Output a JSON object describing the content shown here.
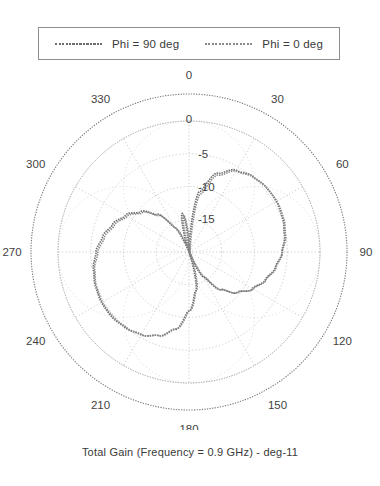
{
  "legend": {
    "entries": [
      {
        "label": "Phi = 90 deg",
        "color": "#6e6e6e",
        "style": "dotted-line"
      },
      {
        "label": "Phi = 0 deg",
        "color": "#8a8a8a",
        "style": "dotted-line"
      }
    ]
  },
  "caption": {
    "text": "Total Gain (Frequency = 0.9 GHz) - deg-11"
  },
  "axes": {
    "angle_labels": [
      "0",
      "30",
      "60",
      "90",
      "120",
      "150",
      "180",
      "210",
      "240",
      "270",
      "300",
      "330"
    ],
    "radial_labels": [
      "0",
      "-5",
      "-10",
      "-15"
    ]
  },
  "chart_data": {
    "type": "line",
    "subtype": "polar",
    "title": "Total Gain (Frequency = 0.9 GHz) - deg-11",
    "xlabel": "Theta (deg)",
    "ylabel": "Total Gain (dB)",
    "rlim": [
      -20,
      0
    ],
    "r_ticks": [
      0,
      -5,
      -10,
      -15
    ],
    "theta_ticks": [
      0,
      30,
      60,
      90,
      120,
      150,
      180,
      210,
      240,
      270,
      300,
      330
    ],
    "theta_zero_location": "N",
    "theta_direction": "clockwise",
    "grid": true,
    "legend_position": "top",
    "series": [
      {
        "name": "Phi = 90 deg",
        "color": "#6e6e6e",
        "theta": [
          0,
          10,
          20,
          30,
          40,
          50,
          60,
          70,
          80,
          90,
          100,
          110,
          120,
          130,
          140,
          150,
          160,
          170,
          180,
          190,
          200,
          210,
          220,
          230,
          240,
          250,
          260,
          270,
          280,
          290,
          300,
          310,
          320,
          330,
          340,
          350,
          360
        ],
        "r": [
          -20,
          -10.6,
          -7.2,
          -5.6,
          -4.9,
          -4.6,
          -4.6,
          -4.8,
          -5.2,
          -5.8,
          -6.6,
          -7.6,
          -8.8,
          -10.4,
          -12.5,
          -15.6,
          -20,
          -14.0,
          -11.0,
          -8.0,
          -6.4,
          -5.4,
          -4.9,
          -4.6,
          -4.6,
          -4.8,
          -5.2,
          -5.8,
          -6.6,
          -7.6,
          -8.8,
          -10.4,
          -12.5,
          -15.6,
          -20,
          -14.0,
          -20
        ]
      },
      {
        "name": "Phi = 0 deg",
        "color": "#8a8a8a",
        "theta": [
          0,
          10,
          20,
          30,
          40,
          50,
          60,
          70,
          80,
          90,
          100,
          110,
          120,
          130,
          140,
          150,
          160,
          170,
          180,
          190,
          200,
          210,
          220,
          230,
          240,
          250,
          260,
          270,
          280,
          290,
          300,
          310,
          320,
          330,
          340,
          350,
          360
        ],
        "r": [
          -20,
          -10.9,
          -7.4,
          -5.7,
          -5.0,
          -4.7,
          -4.6,
          -4.8,
          -5.2,
          -5.9,
          -6.7,
          -7.7,
          -8.9,
          -10.5,
          -12.6,
          -15.8,
          -20,
          -14.2,
          -11.2,
          -8.2,
          -6.5,
          -5.5,
          -5.0,
          -4.7,
          -4.6,
          -4.8,
          -5.2,
          -5.9,
          -6.7,
          -7.7,
          -8.9,
          -10.5,
          -12.6,
          -15.8,
          -20,
          -14.2,
          -20
        ]
      }
    ]
  }
}
